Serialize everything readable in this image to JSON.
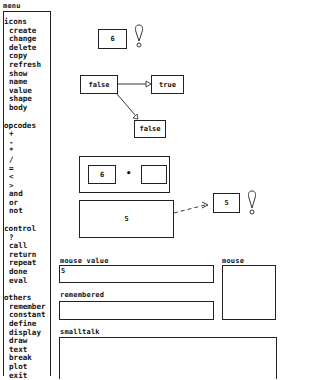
{
  "menu": {
    "title": "menu",
    "sections": [
      {
        "header": "icons",
        "items": [
          "create",
          "change",
          "delete",
          "copy",
          "refresh",
          "show",
          "name",
          "value",
          "shape",
          "body"
        ]
      },
      {
        "header": "opcodes",
        "items": [
          "+",
          "-",
          "*",
          "/",
          "=",
          "<",
          ">",
          "and",
          "or",
          "not"
        ]
      },
      {
        "header": "control",
        "items": [
          "?",
          "call",
          "return",
          "repeat",
          "done",
          "eval"
        ]
      },
      {
        "header": "others",
        "items": [
          "remember",
          "constant",
          "define",
          "display",
          "draw",
          "text",
          "break",
          "plot",
          "exit"
        ]
      }
    ]
  },
  "canvas": {
    "value_box_top": {
      "value": "6"
    },
    "branch": {
      "condition": "false",
      "true_branch": "true",
      "false_branch": "false"
    },
    "multiply": {
      "left": "6",
      "operator": "•",
      "right": ""
    },
    "result_box": {
      "value": "5"
    },
    "output_box": {
      "value": "5"
    }
  },
  "panels": {
    "mouse_value": {
      "label": "mouse value",
      "value": "5"
    },
    "mouse": {
      "label": "mouse"
    },
    "remembered": {
      "label": "remembered",
      "value": ""
    },
    "smalltalk": {
      "label": "smalltalk",
      "value": ""
    }
  }
}
